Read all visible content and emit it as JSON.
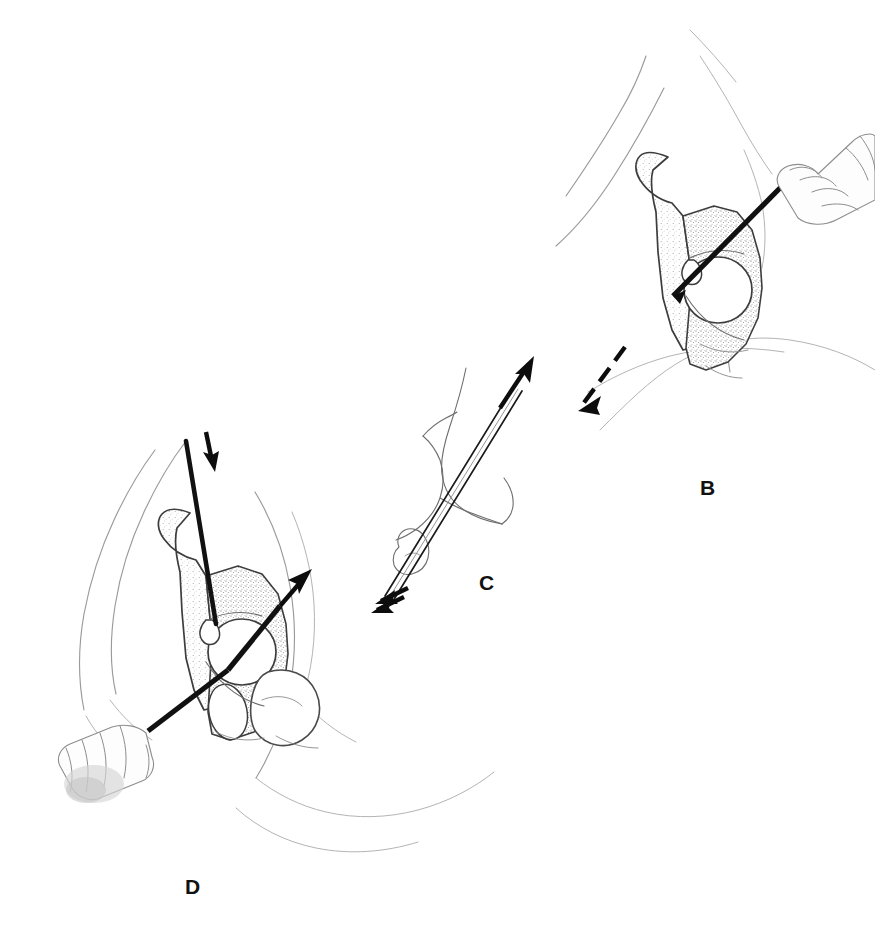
{
  "figure": {
    "style": "pencil and stipple medical illustration",
    "background_color": "#ffffff",
    "ink_color": "#111111",
    "bone_outline_color": "#4a4a4a",
    "skin_outline_color": "#9a9a9a",
    "width": 875,
    "height": 944
  },
  "panels": [
    {
      "id": "B",
      "label": "B",
      "label_x": 700,
      "label_y": 477,
      "description": "Hip and pelvis with surgeon's hand driving an osteotome/drill into the acetabular region; dashed arrow below indicates direction of displacement",
      "elements": [
        {
          "name": "skin-contour",
          "kind": "outline"
        },
        {
          "name": "ilium-bone",
          "kind": "bone"
        },
        {
          "name": "acetabulum",
          "kind": "bone"
        },
        {
          "name": "obturator-foramen",
          "kind": "bone"
        },
        {
          "name": "surgeon-hand",
          "kind": "hand"
        },
        {
          "name": "osteotome-instrument",
          "kind": "instrument"
        },
        {
          "name": "dashed-direction-arrow",
          "kind": "arrow",
          "direction": "down-left"
        }
      ]
    },
    {
      "id": "C",
      "label": "C",
      "label_x": 479,
      "label_y": 572,
      "description": "Line-drawing cross-section of the bone fragment showing the guide pin trajectory; paired solid arrows at entry and a single arrow at exit indicate the pin path",
      "elements": [
        {
          "name": "bone-fragment-outline",
          "kind": "bone"
        },
        {
          "name": "guide-pin",
          "kind": "instrument"
        },
        {
          "name": "entry-arrows",
          "kind": "arrow",
          "direction": "up-right",
          "count": 2
        },
        {
          "name": "exit-arrow",
          "kind": "arrow",
          "direction": "up-right",
          "count": 1
        }
      ]
    },
    {
      "id": "D",
      "label": "D",
      "label_x": 185,
      "label_y": 876,
      "description": "Hip and pelvis with drill entering from below and lateral; a long guide wire passes down through the ilium, a short arrow marks the downward wire direction and a second arrow marks the lateral osteotomy direction",
      "elements": [
        {
          "name": "skin-contour",
          "kind": "outline"
        },
        {
          "name": "ilium-bone",
          "kind": "bone"
        },
        {
          "name": "femoral-head",
          "kind": "bone"
        },
        {
          "name": "acetabulum",
          "kind": "bone"
        },
        {
          "name": "obturator-foramen",
          "kind": "bone"
        },
        {
          "name": "surgeon-hand",
          "kind": "hand"
        },
        {
          "name": "drill-instrument",
          "kind": "instrument"
        },
        {
          "name": "guide-wire",
          "kind": "wire"
        },
        {
          "name": "down-arrow",
          "kind": "arrow",
          "direction": "down"
        },
        {
          "name": "lateral-arrow",
          "kind": "arrow",
          "direction": "up-right"
        }
      ]
    }
  ]
}
